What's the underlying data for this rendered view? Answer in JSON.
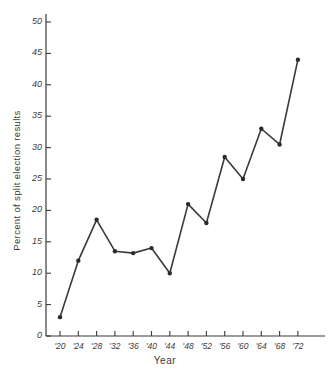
{
  "figure": {
    "title_remnant": "",
    "background_color": "#ffffff",
    "line_color": "#3a3a3a",
    "axis_color": "#3a3a3a",
    "marker_color": "#2b2b2b"
  },
  "chart_data": {
    "type": "line",
    "title": "",
    "xlabel": "Year",
    "ylabel": "Percent of split election results",
    "categories": [
      "'20",
      "'24",
      "'28",
      "'32",
      "'36",
      "'40",
      "'44",
      "'48",
      "'52",
      "'56",
      "'60",
      "'64",
      "'68",
      "'72"
    ],
    "x": [
      1920,
      1924,
      1928,
      1932,
      1936,
      1940,
      1944,
      1948,
      1952,
      1956,
      1960,
      1964,
      1968,
      1972
    ],
    "values": [
      3,
      12,
      18.5,
      13.5,
      13.2,
      14,
      10,
      21,
      18,
      28.5,
      25,
      33,
      30.5,
      44
    ],
    "ylim": [
      0,
      51
    ],
    "xlim": [
      1918,
      1974
    ],
    "yticks": [
      0,
      5,
      10,
      15,
      20,
      25,
      30,
      35,
      40,
      45,
      50
    ],
    "ytick_labels": [
      "0",
      "5",
      "10",
      "15",
      "20",
      "25",
      "30",
      "35",
      "40",
      "45",
      "50"
    ],
    "xticks": [
      1920,
      1924,
      1928,
      1932,
      1936,
      1940,
      1944,
      1948,
      1952,
      1956,
      1960,
      1964,
      1968,
      1972
    ],
    "xtick_labels": [
      "'20",
      "'24",
      "'28",
      "'32",
      "'36",
      "'40",
      "'44",
      "'48",
      "'52",
      "'56",
      "'60",
      "'64",
      "'68",
      "'72"
    ],
    "grid": false,
    "legend": null,
    "markers": "filled-circle",
    "series": [
      {
        "name": "Percent of split election results",
        "values": [
          3,
          12,
          18.5,
          13.5,
          13.2,
          14,
          10,
          21,
          18,
          28.5,
          25,
          33,
          30.5,
          44
        ]
      }
    ]
  }
}
